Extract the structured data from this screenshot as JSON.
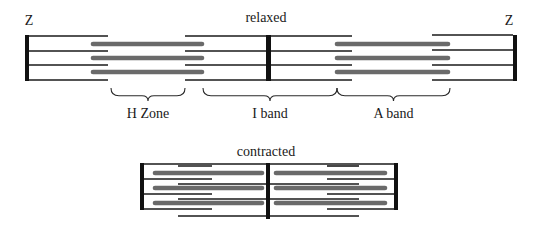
{
  "colors": {
    "background": "#ffffff",
    "actin": "#1a1a1a",
    "myosin": "#6a6a6a",
    "z_line": "#111111",
    "text": "#1a1a1a"
  },
  "relaxed": {
    "title": "relaxed",
    "title_pos": [
      266,
      22
    ],
    "z_labels": [
      {
        "text": "Z",
        "x": 29,
        "y": 25
      },
      {
        "text": "Z",
        "x": 509,
        "y": 25
      }
    ],
    "z_bars": [
      {
        "x": 25,
        "y": 35,
        "w": 4,
        "h": 46
      },
      {
        "x": 266,
        "y": 35,
        "w": 5,
        "h": 46
      },
      {
        "x": 513,
        "y": 35,
        "w": 4,
        "h": 46
      }
    ],
    "actin": [
      {
        "x1": 29,
        "x2": 108,
        "y": 36
      },
      {
        "x1": 29,
        "x2": 108,
        "y": 51
      },
      {
        "x1": 29,
        "x2": 108,
        "y": 65
      },
      {
        "x1": 29,
        "x2": 108,
        "y": 80
      },
      {
        "x1": 185,
        "x2": 266,
        "y": 36
      },
      {
        "x1": 185,
        "x2": 266,
        "y": 51
      },
      {
        "x1": 185,
        "x2": 266,
        "y": 65
      },
      {
        "x1": 185,
        "x2": 266,
        "y": 80
      },
      {
        "x1": 271,
        "x2": 352,
        "y": 36
      },
      {
        "x1": 271,
        "x2": 352,
        "y": 51
      },
      {
        "x1": 271,
        "x2": 352,
        "y": 65
      },
      {
        "x1": 271,
        "x2": 352,
        "y": 80
      },
      {
        "x1": 432,
        "x2": 513,
        "y": 35
      },
      {
        "x1": 432,
        "x2": 513,
        "y": 50
      },
      {
        "x1": 432,
        "x2": 513,
        "y": 65
      },
      {
        "x1": 432,
        "x2": 513,
        "y": 80
      }
    ],
    "myosin": [
      {
        "x1": 93,
        "x2": 202,
        "y": 44
      },
      {
        "x1": 93,
        "x2": 202,
        "y": 58
      },
      {
        "x1": 93,
        "x2": 202,
        "y": 72
      },
      {
        "x1": 337,
        "x2": 448,
        "y": 44
      },
      {
        "x1": 337,
        "x2": 448,
        "y": 58
      },
      {
        "x1": 337,
        "x2": 448,
        "y": 72
      }
    ],
    "braces": [
      {
        "name": "h-zone",
        "label": "H Zone",
        "x1": 111,
        "x2": 185,
        "top": 88,
        "depth": 13,
        "label_y": 118
      },
      {
        "name": "i-band",
        "label": "I band",
        "x1": 203,
        "x2": 337,
        "top": 88,
        "depth": 13,
        "label_y": 118
      },
      {
        "name": "a-band",
        "label": "A band",
        "x1": 337,
        "x2": 450,
        "top": 88,
        "depth": 13,
        "label_y": 118
      }
    ]
  },
  "contracted": {
    "title": "contracted",
    "title_pos": [
      266,
      156
    ],
    "z_bars": [
      {
        "x": 140,
        "y": 163,
        "w": 4,
        "h": 47
      },
      {
        "x": 266,
        "y": 163,
        "w": 4,
        "h": 56
      },
      {
        "x": 394,
        "y": 163,
        "w": 4,
        "h": 47
      }
    ],
    "actin": [
      {
        "x1": 144,
        "x2": 394,
        "y": 164
      },
      {
        "x1": 144,
        "x2": 212,
        "y": 179
      },
      {
        "x1": 144,
        "x2": 212,
        "y": 194
      },
      {
        "x1": 144,
        "x2": 212,
        "y": 209
      },
      {
        "x1": 327,
        "x2": 394,
        "y": 179
      },
      {
        "x1": 327,
        "x2": 394,
        "y": 194
      },
      {
        "x1": 327,
        "x2": 394,
        "y": 209
      },
      {
        "x1": 178,
        "x2": 212,
        "y": 166
      },
      {
        "x1": 178,
        "x2": 266,
        "y": 184
      },
      {
        "x1": 178,
        "x2": 266,
        "y": 199
      },
      {
        "x1": 178,
        "x2": 359,
        "y": 216
      },
      {
        "x1": 327,
        "x2": 359,
        "y": 166
      },
      {
        "x1": 270,
        "x2": 359,
        "y": 184
      },
      {
        "x1": 270,
        "x2": 359,
        "y": 199
      }
    ],
    "myosin": [
      {
        "x1": 155,
        "x2": 262,
        "y": 173
      },
      {
        "x1": 155,
        "x2": 262,
        "y": 188
      },
      {
        "x1": 155,
        "x2": 262,
        "y": 203
      },
      {
        "x1": 276,
        "x2": 385,
        "y": 173
      },
      {
        "x1": 276,
        "x2": 385,
        "y": 188
      },
      {
        "x1": 276,
        "x2": 385,
        "y": 203
      }
    ]
  }
}
